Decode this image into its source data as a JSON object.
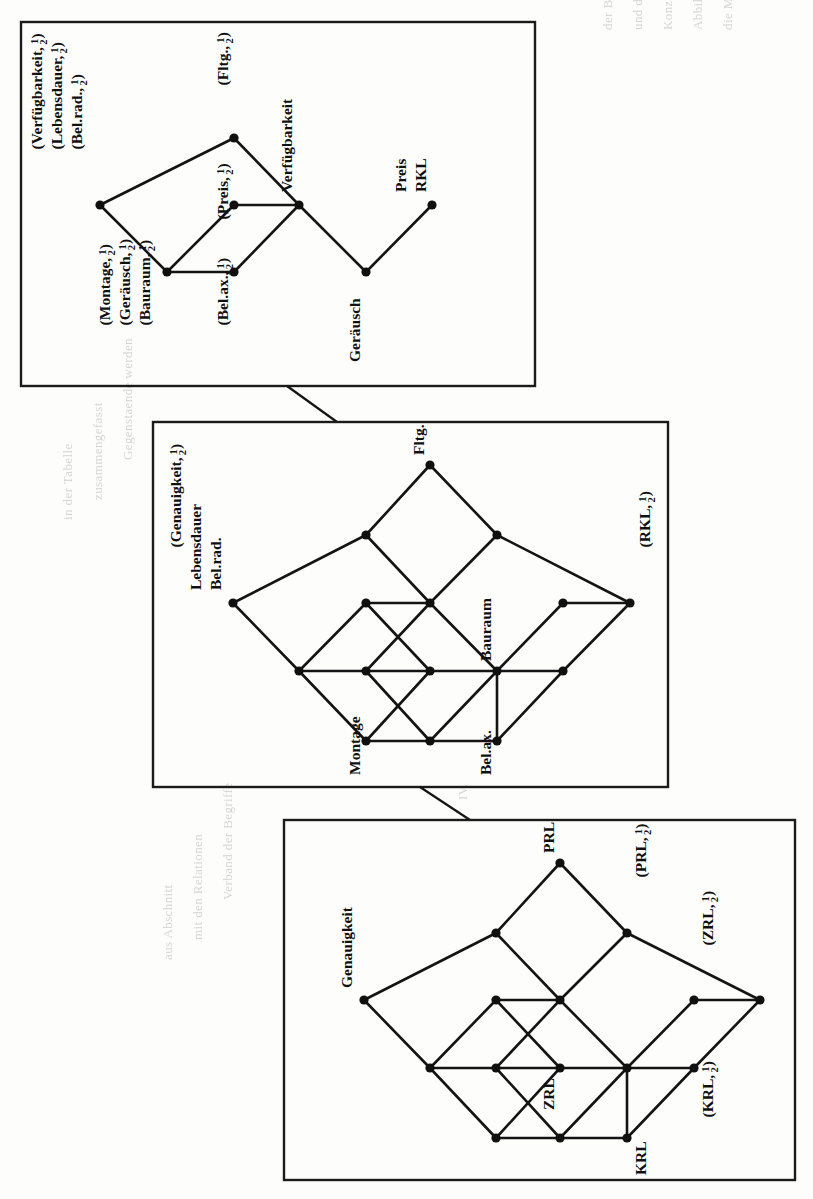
{
  "page": {
    "orientation": "rotated-90-clockwise",
    "background_color": "#fdfdfc",
    "ink_color": "#101010"
  },
  "bleed_text": [
    "der Begriffsverband",
    "und der Kontext",
    "dafu",
    "Konzept",
    "wird",
    "in Abbildung",
    "dargestellt",
    "die",
    "Merkmale",
    "der",
    "Gegenstaende",
    "IV."
  ],
  "figures": [
    {
      "id": "figure-top",
      "name": "lattice-verfuegbarkeit",
      "frame": {
        "x": 21,
        "y": 22,
        "width": 514,
        "height": 364
      },
      "labels": [
        {
          "id": "t1",
          "text": "(Verfügbarkeit, 1/2)",
          "base": "(Verfügbarkeit,",
          "frac": "1/2",
          "tail": ")"
        },
        {
          "id": "t2",
          "text": "(Lebensdauer, 1/2)",
          "base": "(Lebensdauer,",
          "frac": "1/2",
          "tail": ")"
        },
        {
          "id": "t3",
          "text": "(Bel.rad., 1/2)",
          "base": "(Bel.rad.,",
          "frac": "1/2",
          "tail": ")"
        },
        {
          "id": "t4",
          "text": "(Fltg., 1/2)",
          "base": "(Fltg.,",
          "frac": "1/2",
          "tail": ")"
        },
        {
          "id": "t5",
          "text": "(Preis, 1/2)",
          "base": "(Preis,",
          "frac": "1/2",
          "tail": ")"
        },
        {
          "id": "t6",
          "text": "Verfügbarkeit"
        },
        {
          "id": "t7",
          "text": "Preis"
        },
        {
          "id": "t8",
          "text": "RKL"
        },
        {
          "id": "t9",
          "text": "(Montage, 1/2)",
          "base": "(Montage,",
          "frac": "1/2",
          "tail": ")"
        },
        {
          "id": "t10",
          "text": "(Geräusch, 1/2)",
          "base": "(Geräusch,",
          "frac": "1/2",
          "tail": ")"
        },
        {
          "id": "t11",
          "text": "(Bauraum, 1/2)",
          "base": "(Bauraum,",
          "frac": "1/2",
          "tail": ")"
        },
        {
          "id": "t12",
          "text": "(Bel.ax., 1/2)",
          "base": "(Bel.ax.,",
          "frac": "1/2",
          "tail": ")"
        },
        {
          "id": "t13",
          "text": "Geräusch"
        }
      ],
      "nodes": [
        {
          "id": "A",
          "x": 100,
          "y": 205,
          "label": "(Verfügbarkeit, 1/2) (Lebensdauer, 1/2) (Bel.rad., 1/2)"
        },
        {
          "id": "B",
          "x": 234,
          "y": 138,
          "label": "(Fltg., 1/2)"
        },
        {
          "id": "C",
          "x": 234,
          "y": 205,
          "label": "(Preis, 1/2)"
        },
        {
          "id": "D",
          "x": 167,
          "y": 272,
          "label": "(Montage, 1/2) (Geräusch, 1/2) (Bauraum, 1/2)"
        },
        {
          "id": "E",
          "x": 234,
          "y": 272,
          "label": "(Bel.ax., 1/2)"
        },
        {
          "id": "F",
          "x": 299,
          "y": 205,
          "label": "Verfügbarkeit"
        },
        {
          "id": "G",
          "x": 366,
          "y": 272,
          "label": "Geräusch"
        },
        {
          "id": "H",
          "x": 432,
          "y": 205,
          "label": "Preis RKL"
        }
      ],
      "edges": [
        [
          "A",
          "B"
        ],
        [
          "A",
          "D"
        ],
        [
          "B",
          "F"
        ],
        [
          "C",
          "F"
        ],
        [
          "D",
          "E"
        ],
        [
          "D",
          "C"
        ],
        [
          "E",
          "F"
        ],
        [
          "F",
          "G"
        ],
        [
          "G",
          "H"
        ]
      ]
    },
    {
      "id": "figure-middle",
      "name": "lattice-genauigkeit-rkl",
      "frame": {
        "x": 153,
        "y": 422,
        "width": 515,
        "height": 365
      },
      "labels": [
        {
          "id": "m1",
          "text": "(Genauigkeit, 1/2)",
          "base": "(Genauigkeit,",
          "frac": "1/2",
          "tail": ")"
        },
        {
          "id": "m2",
          "text": "Lebensdauer"
        },
        {
          "id": "m3",
          "text": "Bel.rad."
        },
        {
          "id": "m4",
          "text": "Fltg."
        },
        {
          "id": "m5",
          "text": "Bauraum"
        },
        {
          "id": "m6",
          "text": "(RKL, 1/2)",
          "base": "(RKL,",
          "frac": "1/2",
          "tail": ")"
        },
        {
          "id": "m7",
          "text": "Montage"
        },
        {
          "id": "m8",
          "text": "Bel.ax."
        }
      ],
      "nodes": [
        {
          "id": "top",
          "x": 430,
          "y": 465,
          "label": "Fltg."
        },
        {
          "id": "u1",
          "x": 366,
          "y": 535,
          "label": ""
        },
        {
          "id": "u2",
          "x": 497,
          "y": 535,
          "label": ""
        },
        {
          "id": "L",
          "x": 233,
          "y": 603,
          "label": "(Genauigkeit, 1/2) Lebensdauer Bel.rad."
        },
        {
          "id": "m1n",
          "x": 366,
          "y": 603,
          "label": ""
        },
        {
          "id": "m2n",
          "x": 430,
          "y": 603,
          "label": ""
        },
        {
          "id": "m3n",
          "x": 563,
          "y": 603,
          "label": ""
        },
        {
          "id": "R",
          "x": 630,
          "y": 603,
          "label": "(RKL, 1/2)"
        },
        {
          "id": "d1",
          "x": 299,
          "y": 671,
          "label": ""
        },
        {
          "id": "d2",
          "x": 366,
          "y": 671,
          "label": ""
        },
        {
          "id": "d3",
          "x": 430,
          "y": 671,
          "label": ""
        },
        {
          "id": "d4",
          "x": 497,
          "y": 671,
          "label": "Bauraum"
        },
        {
          "id": "d5",
          "x": 563,
          "y": 671,
          "label": ""
        },
        {
          "id": "b1",
          "x": 366,
          "y": 741,
          "label": "Montage"
        },
        {
          "id": "b2",
          "x": 430,
          "y": 741,
          "label": ""
        },
        {
          "id": "b3",
          "x": 497,
          "y": 741,
          "label": "Bel.ax."
        }
      ],
      "edges": [
        [
          "top",
          "u1"
        ],
        [
          "top",
          "u2"
        ],
        [
          "u1",
          "L"
        ],
        [
          "u1",
          "m2n"
        ],
        [
          "u2",
          "m2n"
        ],
        [
          "u2",
          "R"
        ],
        [
          "L",
          "d1"
        ],
        [
          "m1n",
          "m2n"
        ],
        [
          "m1n",
          "d2"
        ],
        [
          "m1n",
          "d1"
        ],
        [
          "m2n",
          "d3"
        ],
        [
          "m2n",
          "d4"
        ],
        [
          "m3n",
          "R"
        ],
        [
          "m3n",
          "d4"
        ],
        [
          "m3n",
          "d5"
        ],
        [
          "d1",
          "d2"
        ],
        [
          "d2",
          "d3"
        ],
        [
          "d3",
          "d4"
        ],
        [
          "d4",
          "d5"
        ],
        [
          "d1",
          "b1"
        ],
        [
          "d2",
          "b2"
        ],
        [
          "d3",
          "b1"
        ],
        [
          "d4",
          "b2"
        ],
        [
          "d4",
          "b3"
        ],
        [
          "d5",
          "b3"
        ],
        [
          "b1",
          "b2"
        ],
        [
          "b2",
          "b3"
        ]
      ]
    },
    {
      "id": "figure-bottom",
      "name": "lattice-genauigkeit-prl",
      "frame": {
        "x": 284,
        "y": 820,
        "width": 511,
        "height": 360
      },
      "labels": [
        {
          "id": "b1l",
          "text": "Genauigkeit"
        },
        {
          "id": "b2l",
          "text": "PRL"
        },
        {
          "id": "b3l",
          "text": "(PRL, 1/2)",
          "base": "(PRL,",
          "frac": "1/2",
          "tail": ")"
        },
        {
          "id": "b4l",
          "text": "(ZRL, 1/2)",
          "base": "(ZRL,",
          "frac": "1/2",
          "tail": ")"
        },
        {
          "id": "b5l",
          "text": "ZRL"
        },
        {
          "id": "b6l",
          "text": "KRL"
        },
        {
          "id": "b7l",
          "text": "(KRL, 1/2)",
          "base": "(KRL,",
          "frac": "1/2",
          "tail": ")"
        }
      ],
      "nodes": [
        {
          "id": "top",
          "x": 560,
          "y": 863,
          "label": "PRL"
        },
        {
          "id": "u1",
          "x": 496,
          "y": 933,
          "label": ""
        },
        {
          "id": "u2",
          "x": 627,
          "y": 933,
          "label": "(PRL, 1/2)"
        },
        {
          "id": "L",
          "x": 364,
          "y": 1000,
          "label": "Genauigkeit"
        },
        {
          "id": "m1n",
          "x": 496,
          "y": 1000,
          "label": ""
        },
        {
          "id": "m2n",
          "x": 560,
          "y": 1000,
          "label": ""
        },
        {
          "id": "m3n",
          "x": 694,
          "y": 1000,
          "label": ""
        },
        {
          "id": "R",
          "x": 760,
          "y": 1000,
          "label": "(ZRL, 1/2)"
        },
        {
          "id": "d1",
          "x": 430,
          "y": 1068,
          "label": ""
        },
        {
          "id": "d2",
          "x": 496,
          "y": 1068,
          "label": ""
        },
        {
          "id": "d3",
          "x": 560,
          "y": 1068,
          "label": "ZRL"
        },
        {
          "id": "d4",
          "x": 627,
          "y": 1068,
          "label": ""
        },
        {
          "id": "d5",
          "x": 694,
          "y": 1068,
          "label": "(KRL, 1/2)"
        },
        {
          "id": "bb1",
          "x": 496,
          "y": 1138,
          "label": ""
        },
        {
          "id": "bb2",
          "x": 560,
          "y": 1138,
          "label": ""
        },
        {
          "id": "bb3",
          "x": 627,
          "y": 1138,
          "label": "KRL"
        }
      ],
      "edges": [
        [
          "top",
          "u1"
        ],
        [
          "top",
          "u2"
        ],
        [
          "u1",
          "L"
        ],
        [
          "u1",
          "m2n"
        ],
        [
          "u2",
          "m2n"
        ],
        [
          "u2",
          "R"
        ],
        [
          "L",
          "d1"
        ],
        [
          "m1n",
          "m2n"
        ],
        [
          "m1n",
          "d2"
        ],
        [
          "m1n",
          "d1"
        ],
        [
          "m2n",
          "d3"
        ],
        [
          "m2n",
          "d4"
        ],
        [
          "m3n",
          "R"
        ],
        [
          "m3n",
          "d4"
        ],
        [
          "m3n",
          "d5"
        ],
        [
          "d1",
          "d2"
        ],
        [
          "d2",
          "d3"
        ],
        [
          "d3",
          "d4"
        ],
        [
          "d4",
          "d5"
        ],
        [
          "d1",
          "bb1"
        ],
        [
          "d2",
          "bb2"
        ],
        [
          "d3",
          "bb1"
        ],
        [
          "d4",
          "bb2"
        ],
        [
          "d4",
          "bb3"
        ],
        [
          "d5",
          "bb3"
        ],
        [
          "bb1",
          "bb2"
        ],
        [
          "bb2",
          "bb3"
        ]
      ]
    }
  ],
  "connectors": [
    {
      "id": "connector-top-middle",
      "from": [
        287,
        386
      ],
      "to": [
        337,
        422
      ]
    },
    {
      "id": "connector-middle-bottom",
      "from": [
        420,
        787
      ],
      "to": [
        470,
        820
      ]
    }
  ]
}
